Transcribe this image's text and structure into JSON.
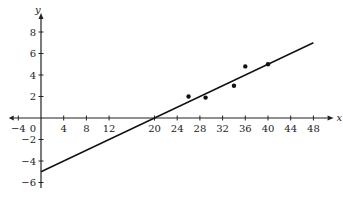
{
  "chart_data": {
    "type": "scatter",
    "title": "",
    "xlabel": "x",
    "ylabel": "y",
    "xlim": [
      -4,
      50
    ],
    "ylim": [
      -6.5,
      9
    ],
    "grid": false,
    "x_ticks": [
      -4,
      0,
      4,
      8,
      12,
      20,
      24,
      28,
      32,
      36,
      40,
      44,
      48
    ],
    "y_ticks": [
      8,
      6,
      4,
      2,
      -2,
      -4,
      -6
    ],
    "series": [
      {
        "name": "data points",
        "kind": "scatter",
        "points": [
          {
            "x": 26,
            "y": 2.0
          },
          {
            "x": 29,
            "y": 1.9
          },
          {
            "x": 34,
            "y": 3.0
          },
          {
            "x": 36,
            "y": 4.8
          },
          {
            "x": 40,
            "y": 5.0
          }
        ]
      },
      {
        "name": "line of best fit",
        "kind": "line",
        "points": [
          {
            "x": 0,
            "y": -5
          },
          {
            "x": 20,
            "y": 0
          },
          {
            "x": 48,
            "y": 7
          }
        ],
        "slope": 0.25,
        "intercept": -5
      }
    ]
  }
}
